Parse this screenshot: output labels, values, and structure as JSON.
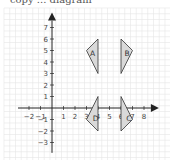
{
  "header": {
    "cut_text": "copy ... diagram"
  },
  "chart_data": {
    "type": "diagram",
    "title": "",
    "axes": {
      "x_ticks": [
        -2,
        -1,
        1,
        2,
        3,
        4,
        5,
        6,
        7,
        8
      ],
      "y_ticks": [
        -3,
        -2,
        -1,
        1,
        2,
        3,
        4,
        5,
        6,
        7
      ],
      "xlim": [
        -3,
        9
      ],
      "ylim": [
        -4,
        8
      ],
      "grid": true
    },
    "shapes": [
      {
        "label": "A",
        "vertices": [
          [
            4,
            6
          ],
          [
            3,
            5
          ],
          [
            4,
            3
          ]
        ],
        "label_pos": [
          3.3,
          4.8
        ]
      },
      {
        "label": "B",
        "vertices": [
          [
            6,
            6
          ],
          [
            7,
            5
          ],
          [
            6,
            3
          ]
        ],
        "label_pos": [
          6.3,
          4.8
        ]
      },
      {
        "label": "D",
        "vertices": [
          [
            4,
            1
          ],
          [
            3,
            -1
          ],
          [
            4,
            -2
          ]
        ],
        "label_pos": [
          3.55,
          -0.85
        ]
      },
      {
        "label": "C",
        "vertices": [
          [
            6,
            1
          ],
          [
            7,
            -1
          ],
          [
            6,
            -2
          ]
        ],
        "label_pos": [
          6.45,
          -0.85
        ]
      }
    ],
    "colors": {
      "fill": "#d9d9d9",
      "stroke": "#333333",
      "grid": "#e6e6e6",
      "axis": "#222222"
    }
  }
}
